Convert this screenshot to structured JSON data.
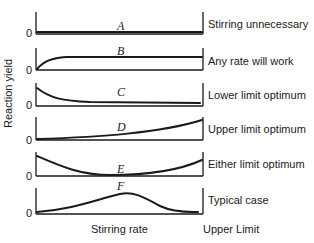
{
  "diagram": {
    "ylabel": "Reaction yield",
    "xlabel": "Stirring rate",
    "x_end_label": "Upper Limit",
    "zero_label": "0",
    "panels": [
      {
        "letter": "A",
        "label": "Stirring unnecessary"
      },
      {
        "letter": "B",
        "label": "Any rate will work"
      },
      {
        "letter": "C",
        "label": "Lower limit optimum"
      },
      {
        "letter": "D",
        "label": "Upper limit optimum"
      },
      {
        "letter": "E",
        "label": "Either limit optimum"
      },
      {
        "letter": "F",
        "label": "Typical case"
      }
    ]
  }
}
